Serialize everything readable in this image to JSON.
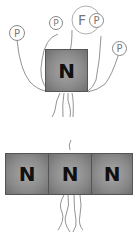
{
  "figure": {
    "top_panel": {
      "core_label": "N",
      "satellites": [
        {
          "label": "P",
          "position": "left"
        },
        {
          "label": "P",
          "position": "upper-left"
        },
        {
          "label": "F",
          "position": "top-large"
        },
        {
          "label": "P",
          "position": "top-overlap"
        },
        {
          "label": "P",
          "position": "right"
        }
      ]
    },
    "bottom_panel": {
      "blocks": [
        {
          "label": "N"
        },
        {
          "label": "N"
        },
        {
          "label": "N"
        }
      ]
    }
  }
}
